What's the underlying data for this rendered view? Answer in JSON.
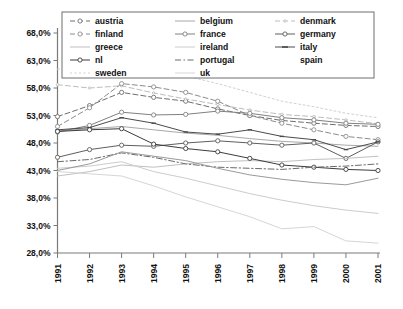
{
  "chart_data": {
    "type": "line",
    "title": "",
    "xlabel": "",
    "ylabel": "",
    "grid": false,
    "legend_position": "top",
    "x": [
      "1991",
      "1992",
      "1993",
      "1994",
      "1995",
      "1996",
      "1997",
      "1998",
      "1999",
      "2000",
      "2001"
    ],
    "ylim": [
      28.0,
      68.0
    ],
    "ytick_labels": [
      "68,0%",
      "63,0%",
      "58,0%",
      "53,0%",
      "48,0%",
      "43,0%",
      "38,0%",
      "33,0%",
      "28,0%"
    ],
    "ytick_values": [
      68.0,
      63.0,
      58.0,
      53.0,
      48.0,
      43.0,
      38.0,
      33.0,
      28.0
    ],
    "series": [
      {
        "name": "austria",
        "label": "austria",
        "style": "dashed",
        "marker": "circle",
        "color": "#6e6e6e",
        "values": [
          52.8,
          54.8,
          57.2,
          56.3,
          55.6,
          54.2,
          53.0,
          52.1,
          51.6,
          51.2,
          51.0
        ]
      },
      {
        "name": "belgium",
        "label": "belgium",
        "style": "solid",
        "marker": "none",
        "color": "#a8a8a8",
        "values": [
          50.2,
          50.6,
          51.0,
          50.4,
          49.8,
          49.4,
          48.8,
          48.3,
          48.0,
          47.6,
          47.4
        ]
      },
      {
        "name": "denmark",
        "label": "denmark",
        "style": "dashed",
        "marker": "dot",
        "color": "#bdbdbd",
        "values": [
          58.6,
          58.0,
          58.4,
          57.1,
          56.0,
          55.0,
          54.0,
          53.2,
          52.8,
          52.2,
          51.5
        ]
      },
      {
        "name": "finland",
        "label": "finland",
        "style": "dashed",
        "marker": "circle",
        "color": "#8c8c8c",
        "values": [
          51.0,
          54.4,
          58.8,
          58.2,
          57.2,
          55.6,
          53.0,
          51.6,
          50.4,
          49.2,
          48.6
        ]
      },
      {
        "name": "france",
        "label": "france",
        "style": "solid",
        "marker": "circle",
        "color": "#808080",
        "values": [
          50.0,
          51.2,
          53.6,
          53.1,
          53.2,
          53.8,
          53.4,
          52.6,
          52.2,
          51.6,
          51.4
        ]
      },
      {
        "name": "germany",
        "label": "germany",
        "style": "solid",
        "marker": "circle",
        "color": "#5e5e5e",
        "values": [
          45.4,
          46.8,
          47.6,
          47.4,
          48.0,
          48.4,
          48.0,
          47.6,
          48.0,
          45.2,
          48.2
        ]
      },
      {
        "name": "greece",
        "label": "greece",
        "style": "solid",
        "marker": "none",
        "color": "#c0c0c0",
        "values": [
          42.0,
          42.8,
          44.0,
          43.6,
          44.2,
          44.6,
          44.8,
          44.6,
          45.0,
          45.2,
          45.6
        ]
      },
      {
        "name": "ireland",
        "label": "ireland",
        "style": "solid",
        "marker": "none",
        "color": "#cccccc",
        "values": [
          43.4,
          43.8,
          44.6,
          42.8,
          41.6,
          40.2,
          38.8,
          37.6,
          36.6,
          35.8,
          35.2
        ]
      },
      {
        "name": "italy",
        "label": "italy",
        "style": "solid",
        "marker": "dash",
        "color": "#4a4a4a",
        "values": [
          50.4,
          50.8,
          52.6,
          51.6,
          50.0,
          49.6,
          50.4,
          49.2,
          48.6,
          46.8,
          48.2
        ]
      },
      {
        "name": "nl",
        "label": "nl",
        "style": "solid",
        "marker": "circle",
        "color": "#3c3c3c",
        "values": [
          50.1,
          50.4,
          50.6,
          47.8,
          47.0,
          46.4,
          45.2,
          44.0,
          43.6,
          43.2,
          43.0
        ]
      },
      {
        "name": "portugal",
        "label": "portugal",
        "style": "dashdot",
        "marker": "none",
        "color": "#6a6a6a",
        "values": [
          44.6,
          45.0,
          46.2,
          45.4,
          44.2,
          43.6,
          43.4,
          43.2,
          43.6,
          43.8,
          44.2
        ]
      },
      {
        "name": "spain",
        "label": "spain",
        "style": "solid",
        "marker": "none",
        "color": "#9a9a9a",
        "values": [
          43.0,
          44.2,
          46.4,
          45.6,
          44.8,
          43.4,
          42.2,
          41.4,
          40.8,
          40.4,
          41.6
        ]
      },
      {
        "name": "sweden",
        "label": "sweden",
        "style": "dotted",
        "marker": "none",
        "color": "#d0d0d0",
        "values": [
          61.4,
          62.0,
          63.0,
          62.2,
          60.2,
          58.8,
          57.2,
          55.6,
          54.6,
          53.4,
          52.6
        ]
      },
      {
        "name": "uk",
        "label": "uk",
        "style": "solid",
        "marker": "none",
        "color": "#d6d6d6",
        "values": [
          42.8,
          42.4,
          42.0,
          40.2,
          38.2,
          36.4,
          34.6,
          32.4,
          32.8,
          30.2,
          29.8
        ]
      }
    ],
    "legend_columns": [
      [
        "austria",
        "finland",
        "greece",
        "nl",
        "sweden"
      ],
      [
        "belgium",
        "france",
        "ireland",
        "portugal",
        "uk"
      ],
      [
        "denmark",
        "germany",
        "italy",
        "spain"
      ]
    ]
  }
}
